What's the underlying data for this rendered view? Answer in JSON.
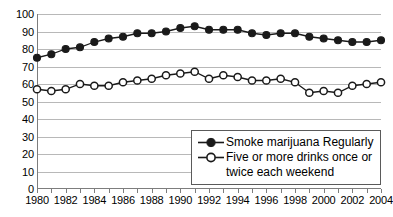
{
  "chart_data": {
    "type": "line",
    "title": "",
    "subtitle": "",
    "xlabel": "",
    "ylabel": "",
    "xlim": [
      1980,
      2004
    ],
    "ylim": [
      0,
      100
    ],
    "grid": true,
    "legend_position": "bottom-right",
    "x": [
      1980,
      1981,
      1982,
      1983,
      1984,
      1985,
      1986,
      1987,
      1988,
      1989,
      1990,
      1991,
      1992,
      1993,
      1994,
      1995,
      1996,
      1997,
      1998,
      1999,
      2000,
      2001,
      2002,
      2003,
      2004
    ],
    "xtick_labels": [
      "1980",
      "1982",
      "1984",
      "1986",
      "1988",
      "1990",
      "1992",
      "1994",
      "1996",
      "1998",
      "2000",
      "2002",
      "2004"
    ],
    "xtick_values": [
      1980,
      1982,
      1984,
      1986,
      1988,
      1990,
      1992,
      1994,
      1996,
      1998,
      2000,
      2002,
      2004
    ],
    "ytick_labels": [
      "100",
      "90",
      "80",
      "70",
      "60",
      "50",
      "40",
      "30",
      "20",
      "10",
      "0"
    ],
    "ytick_values": [
      100,
      90,
      80,
      70,
      60,
      50,
      40,
      30,
      20,
      10,
      0
    ],
    "series": [
      {
        "name": "Smoke marijuana Regularly",
        "marker": "filled-circle",
        "color": "#1a1a1a",
        "values": [
          75,
          77,
          80,
          81,
          84,
          86,
          87,
          89,
          89,
          90,
          92,
          93,
          91,
          91,
          91,
          89,
          88,
          89,
          89,
          87,
          86,
          85,
          84,
          84,
          85
        ]
      },
      {
        "name": "Five or more drinks once or twice each weekend",
        "marker": "open-circle",
        "color": "#1a1a1a",
        "values": [
          57,
          56,
          57,
          60,
          59,
          59,
          61,
          62,
          63,
          65,
          66,
          67,
          63,
          65,
          64,
          62,
          62,
          63,
          61,
          55,
          56,
          55,
          59,
          60,
          61
        ]
      }
    ]
  },
  "legend": {
    "entries": [
      {
        "key": "filled-circle",
        "label": "Smoke marijuana Regularly",
        "label_line2": ""
      },
      {
        "key": "open-circle",
        "label": "Five or more drinks once or",
        "label_line2": "twice each weekend"
      }
    ]
  }
}
